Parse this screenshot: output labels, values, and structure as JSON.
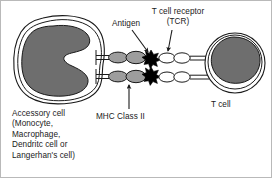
{
  "figure": {
    "background_color": "#ffffff",
    "border_color": "#b9b9b9",
    "line_color": "#1a1a1a",
    "nucleus_fill": "#6e6e6e",
    "mhc_fill": "#9d9d9d",
    "tcr_fill": "#ffffff",
    "antigen_fill": "#000000"
  },
  "labels": {
    "accessory_cell": "Accessory cell\n(Monocyte,\nMacrophage,\nDendritc cell or\nLangerhan's cell)",
    "antigen": "Antigen",
    "t_cell_receptor": "T cell receptor\n(TCR)",
    "mhc_class_ii": "MHC Class II",
    "t_cell": "T cell"
  },
  "structures": {
    "accessory_cell": {
      "name": "Accessory cell",
      "membrane": "irregular-rounded-outline",
      "nucleus": "kidney-bean-shaped",
      "nucleus_color": "#6e6e6e"
    },
    "t_cell": {
      "name": "T cell",
      "membrane": "circular-outline",
      "nucleus": "large-round",
      "nucleus_color": "#6e6e6e"
    },
    "mhc_class_ii": {
      "name": "MHC Class II",
      "count": 2,
      "shape": "two-lobed-ellipse-on-stem",
      "fill": "#9d9d9d"
    },
    "t_cell_receptor": {
      "name": "T cell receptor (TCR)",
      "count": 2,
      "shape": "two-lobed-ellipse-on-stem",
      "fill": "#ffffff"
    },
    "antigen": {
      "name": "Antigen",
      "count": 2,
      "shape": "star-burst",
      "fill": "#000000"
    }
  },
  "annotations": [
    {
      "label": "Antigen",
      "points_to": "antigen-star",
      "direction": "down-right"
    },
    {
      "label": "T cell receptor (TCR)",
      "points_to": "t-cell-receptor",
      "direction": "down"
    },
    {
      "label": "MHC Class II",
      "points_to": "mhc-molecule",
      "direction": "up"
    }
  ]
}
